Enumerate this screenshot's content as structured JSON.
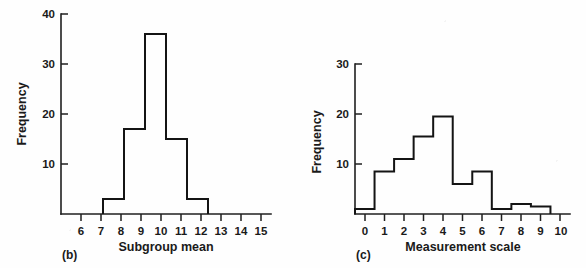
{
  "figure": {
    "background_color": "#fefefe",
    "ink_color": "#141414",
    "panels": [
      {
        "id": "b",
        "panel_label": "(b)",
        "ylabel": "Frequency",
        "xlabel": "Subgroup mean"
      },
      {
        "id": "c",
        "panel_label": "(c)",
        "ylabel": "Frequency",
        "xlabel": "Measurement scale"
      }
    ]
  },
  "chart_data": [
    {
      "type": "bar",
      "id": "panel-b-histogram",
      "title": "",
      "panel_label": "(b)",
      "xlabel": "Subgroup mean",
      "ylabel": "Frequency",
      "xlim": [
        5.5,
        15.5
      ],
      "ylim": [
        0,
        40
      ],
      "xticks": [
        6,
        7,
        8,
        9,
        10,
        11,
        12,
        13,
        14,
        15
      ],
      "xtick_labels": [
        "6",
        "7",
        "8",
        "9",
        "10",
        "11",
        "12",
        "13",
        "14",
        "15"
      ],
      "yticks": [
        10,
        20,
        30,
        40
      ],
      "ytick_labels": [
        "10",
        "20",
        "30",
        "40"
      ],
      "grid": false,
      "legend": false,
      "bin_width": 1,
      "bin_edges": [
        7.5,
        8.5,
        9.5,
        10.5,
        11.5,
        12.5
      ],
      "bin_centers": [
        8,
        9,
        10,
        11,
        12
      ],
      "categories": [
        "8",
        "9",
        "10",
        "11",
        "12"
      ],
      "values": [
        3,
        17,
        36,
        15,
        3
      ]
    },
    {
      "type": "bar",
      "id": "panel-c-histogram",
      "title": "",
      "panel_label": "(c)",
      "xlabel": "Measurement scale",
      "ylabel": "Frequency",
      "xlim": [
        -0.5,
        10.5
      ],
      "ylim": [
        0,
        30
      ],
      "xticks": [
        0,
        1,
        2,
        3,
        4,
        5,
        6,
        7,
        8,
        9,
        10
      ],
      "xtick_labels": [
        "0",
        "1",
        "2",
        "3",
        "4",
        "5",
        "6",
        "7",
        "8",
        "9",
        "10"
      ],
      "yticks": [
        10,
        20,
        30
      ],
      "ytick_labels": [
        "10",
        "20",
        "30"
      ],
      "grid": false,
      "legend": false,
      "bin_width": 1,
      "bin_edges": [
        -0.5,
        0.5,
        1.5,
        2.5,
        3.5,
        4.5,
        5.5,
        6.5,
        7.5,
        8.5,
        9.5
      ],
      "bin_centers": [
        0,
        1,
        2,
        3,
        4,
        5,
        6,
        7,
        8,
        9
      ],
      "categories": [
        "0",
        "1",
        "2",
        "3",
        "4",
        "5",
        "6",
        "7",
        "8",
        "9"
      ],
      "values": [
        1,
        8.5,
        11,
        15.5,
        19.5,
        6,
        8.5,
        1,
        2,
        1.5
      ]
    }
  ]
}
